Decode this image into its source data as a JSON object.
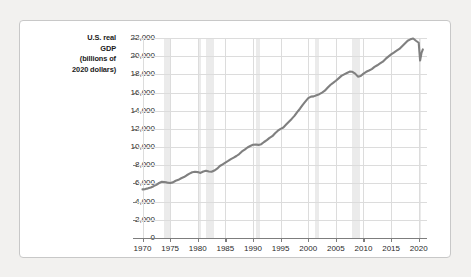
{
  "chart_data": {
    "type": "line",
    "title": "",
    "ylabel": "U.S. real GDP (billions of 2020 dollars)",
    "ylabel_lines": [
      "U.S. real",
      "GDP",
      "(billions of",
      "2020 dollars)"
    ],
    "xlabel": "",
    "xlim": [
      1969.0,
      2021.5
    ],
    "ylim": [
      0,
      22000
    ],
    "grid": true,
    "legend": "none",
    "line_color": "#808080",
    "band_color": "#ebebeb",
    "gridline_color": "#dcdcdc",
    "axis_color": "#7d7d7d",
    "ytick_labels": [
      "22,000",
      "20,000",
      "18,000",
      "16,000",
      "14,000",
      "12,000",
      "10,000",
      "8,000",
      "6,000",
      "4,000",
      "2,000",
      "0"
    ],
    "ytick_values": [
      22000,
      20000,
      18000,
      16000,
      14000,
      12000,
      10000,
      8000,
      6000,
      4000,
      2000,
      0
    ],
    "xtick_labels": [
      "1970",
      "1975",
      "1980",
      "1985",
      "1990",
      "1995",
      "2000",
      "2005",
      "2010",
      "2015",
      "2020"
    ],
    "xtick_values": [
      1970,
      1975,
      1980,
      1985,
      1990,
      1995,
      2000,
      2005,
      2010,
      2015,
      2020
    ],
    "recession_bands": [
      {
        "start": 1973.9,
        "end": 1975.2
      },
      {
        "start": 1980.0,
        "end": 1980.5
      },
      {
        "start": 1981.5,
        "end": 1982.9
      },
      {
        "start": 1990.5,
        "end": 1991.2
      },
      {
        "start": 2001.2,
        "end": 2001.9
      },
      {
        "start": 2007.9,
        "end": 2009.4
      },
      {
        "start": 2020.1,
        "end": 2020.5
      }
    ],
    "series": [
      {
        "name": "U.S. real GDP",
        "x": [
          1970.0,
          1970.5,
          1971.0,
          1971.5,
          1972.0,
          1972.5,
          1973.0,
          1973.5,
          1974.0,
          1974.5,
          1975.0,
          1975.5,
          1976.0,
          1976.5,
          1977.0,
          1977.5,
          1978.0,
          1978.5,
          1979.0,
          1979.5,
          1980.0,
          1980.5,
          1981.0,
          1981.5,
          1982.0,
          1982.5,
          1983.0,
          1983.5,
          1984.0,
          1984.5,
          1985.0,
          1985.5,
          1986.0,
          1986.5,
          1987.0,
          1987.5,
          1988.0,
          1988.5,
          1989.0,
          1989.5,
          1990.0,
          1990.5,
          1991.0,
          1991.5,
          1992.0,
          1992.5,
          1993.0,
          1993.5,
          1994.0,
          1994.5,
          1995.0,
          1995.5,
          1996.0,
          1996.5,
          1997.0,
          1997.5,
          1998.0,
          1998.5,
          1999.0,
          1999.5,
          2000.0,
          2000.5,
          2001.0,
          2001.5,
          2002.0,
          2002.5,
          2003.0,
          2003.5,
          2004.0,
          2004.5,
          2005.0,
          2005.5,
          2006.0,
          2006.5,
          2007.0,
          2007.5,
          2008.0,
          2008.5,
          2009.0,
          2009.5,
          2010.0,
          2010.5,
          2011.0,
          2011.5,
          2012.0,
          2012.5,
          2013.0,
          2013.5,
          2014.0,
          2014.5,
          2015.0,
          2015.5,
          2016.0,
          2016.5,
          2017.0,
          2017.5,
          2018.0,
          2018.5,
          2019.0,
          2019.5,
          2020.0,
          2020.25,
          2020.5,
          2020.75
        ],
        "y": [
          5350,
          5380,
          5460,
          5560,
          5700,
          5850,
          6050,
          6180,
          6150,
          6090,
          6050,
          6120,
          6300,
          6400,
          6570,
          6700,
          6900,
          7080,
          7230,
          7280,
          7250,
          7160,
          7320,
          7400,
          7320,
          7280,
          7420,
          7620,
          7920,
          8100,
          8300,
          8480,
          8680,
          8840,
          9020,
          9230,
          9520,
          9720,
          9960,
          10120,
          10250,
          10290,
          10240,
          10320,
          10560,
          10760,
          11010,
          11200,
          11530,
          11800,
          12010,
          12160,
          12480,
          12790,
          13100,
          13430,
          13850,
          14220,
          14650,
          15020,
          15380,
          15550,
          15580,
          15700,
          15820,
          16000,
          16200,
          16520,
          16830,
          17060,
          17300,
          17560,
          17830,
          18000,
          18150,
          18300,
          18280,
          18080,
          17750,
          17820,
          18080,
          18280,
          18420,
          18580,
          18820,
          19000,
          19200,
          19400,
          19700,
          19950,
          20200,
          20400,
          20600,
          20800,
          21100,
          21400,
          21700,
          21850,
          21950,
          21700,
          21480,
          19520,
          20350,
          20750
        ]
      }
    ]
  }
}
